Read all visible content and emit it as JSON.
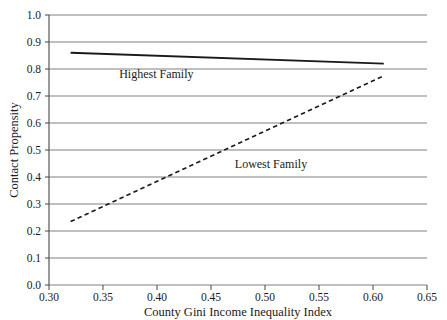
{
  "chart_data": {
    "type": "line",
    "title": "",
    "xlabel": "County Gini Income Inequality Index",
    "ylabel": "Contact Propensity",
    "xlim": [
      0.3,
      0.65
    ],
    "ylim": [
      0.0,
      1.0
    ],
    "xticks": [
      "0.30",
      "0.35",
      "0.40",
      "0.45",
      "0.50",
      "0.55",
      "0.60",
      "0.65"
    ],
    "xtick_values": [
      0.3,
      0.35,
      0.4,
      0.45,
      0.5,
      0.55,
      0.6,
      0.65
    ],
    "yticks": [
      "0.0",
      "0.1",
      "0.2",
      "0.3",
      "0.4",
      "0.5",
      "0.6",
      "0.7",
      "0.8",
      "0.9",
      "1.0"
    ],
    "ytick_values": [
      0.0,
      0.1,
      0.2,
      0.3,
      0.4,
      0.5,
      0.6,
      0.7,
      0.8,
      0.9,
      1.0
    ],
    "grid": "horizontal",
    "legend_position": "inline-annotations",
    "series": [
      {
        "name": "Highest Family",
        "style": "solid",
        "color": "#1a1a1a",
        "x": [
          0.32,
          0.61
        ],
        "values": [
          0.86,
          0.82
        ],
        "annotation": "Highest Family",
        "annotation_at": {
          "x": 0.365,
          "y": 0.765
        }
      },
      {
        "name": "Lowest Family",
        "style": "dashed",
        "color": "#1a1a1a",
        "x": [
          0.32,
          0.61
        ],
        "values": [
          0.235,
          0.775
        ],
        "annotation": "Lowest Family",
        "annotation_at": {
          "x": 0.472,
          "y": 0.435
        }
      }
    ]
  },
  "axes": {
    "x_title": "County Gini Income Inequality Index",
    "y_title": "Contact Propensity",
    "x_tick_labels": [
      "0.30",
      "0.35",
      "0.40",
      "0.45",
      "0.50",
      "0.55",
      "0.60",
      "0.65"
    ],
    "y_tick_labels": [
      "0.0",
      "0.1",
      "0.2",
      "0.3",
      "0.4",
      "0.5",
      "0.6",
      "0.7",
      "0.8",
      "0.9",
      "1.0"
    ]
  },
  "annotations": {
    "highest_family": "Highest Family",
    "lowest_family": "Lowest Family"
  },
  "colors": {
    "line": "#1a1a1a",
    "grid": "#808080",
    "axis": "#555555",
    "background": "#ffffff",
    "text": "#1a1a1a"
  }
}
